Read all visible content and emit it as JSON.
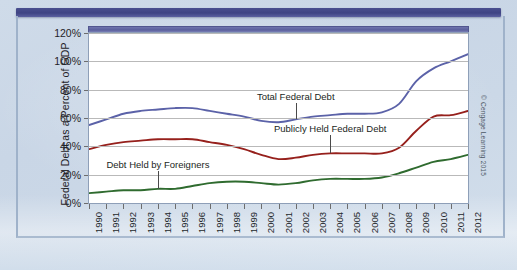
{
  "figure": {
    "credit": "© Cengage Learning 2015",
    "yaxis_title": "Federal Debt as a Percent of GDP"
  },
  "colors": {
    "total_federal_debt": "#5b62a8",
    "publicly_held_federal_debt": "#96201c",
    "debt_held_by_foreigners": "#2f6b2f",
    "gridline": "#b9b9b9",
    "plot_background": "#ffffff",
    "page_background": "#ccd9e8",
    "header_band": "#3e4383"
  },
  "chart_data": {
    "type": "line",
    "title": "",
    "xlabel": "",
    "ylabel": "Federal Debt as a Percent of GDP",
    "ylim": [
      0,
      120
    ],
    "yticks": [
      0,
      20,
      40,
      60,
      80,
      100,
      120
    ],
    "ytick_labels": [
      "0%",
      "20%",
      "40%",
      "60%",
      "80%",
      "100%",
      "120%"
    ],
    "grid": true,
    "legend": "annotated-inline",
    "categories": [
      "1990",
      "1991",
      "1992",
      "1993",
      "1994",
      "1995",
      "1996",
      "1997",
      "1998",
      "1999",
      "2000",
      "2001",
      "2002",
      "2003",
      "2004",
      "2005",
      "2006",
      "2007",
      "2008",
      "2009",
      "2010",
      "2011",
      "2012"
    ],
    "series": [
      {
        "name": "Total Federal Debt",
        "color": "#5b62a8",
        "values": [
          55,
          59,
          63,
          65,
          66,
          67,
          67,
          65,
          63,
          61,
          58,
          57,
          59,
          61,
          62,
          63,
          63,
          64,
          70,
          86,
          95,
          100,
          105
        ]
      },
      {
        "name": "Publicly Held Federal Debt",
        "color": "#96201c",
        "values": [
          38,
          41,
          43,
          44,
          45,
          45,
          45,
          43,
          41,
          38,
          34,
          31,
          32,
          34,
          35,
          35,
          35,
          35,
          39,
          51,
          61,
          62,
          65
        ]
      },
      {
        "name": "Debt Held by Foreigners",
        "color": "#2f6b2f",
        "values": [
          7,
          8,
          9,
          9,
          10,
          10,
          12,
          14,
          15,
          15,
          14,
          13,
          14,
          16,
          17,
          17,
          17,
          18,
          21,
          25,
          29,
          31,
          34
        ]
      }
    ],
    "annotations": [
      {
        "text": "Total Federal Debt",
        "series": "Total Federal Debt",
        "x_year": "2002",
        "label_value": 75
      },
      {
        "text": "Publicly Held Federal Debt",
        "series": "Publicly Held Federal Debt",
        "x_year": "2004",
        "label_value": 52
      },
      {
        "text": "Debt Held by Foreigners",
        "series": "Debt Held by Foreigners",
        "x_year": "1994",
        "label_value": 27
      }
    ]
  }
}
